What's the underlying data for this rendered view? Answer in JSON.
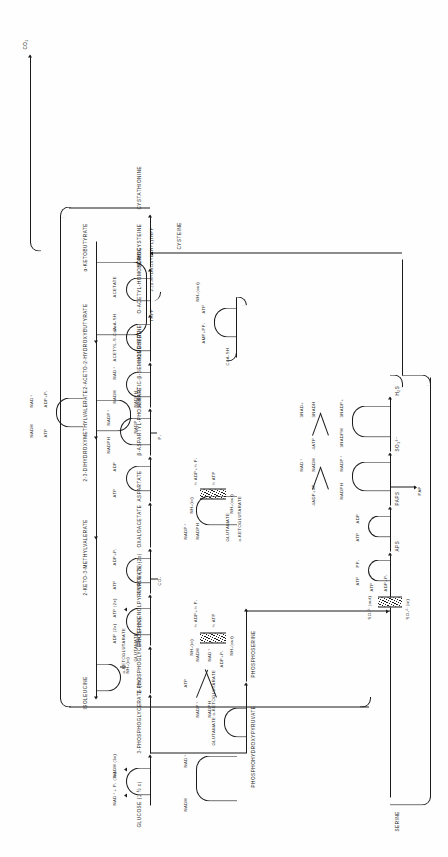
{
  "figure": {
    "kind": "biochemical-pathway-diagram",
    "orientation": "rotated-90-counterclockwise",
    "ink": "#1b1b1b",
    "paper": "#fefefe"
  },
  "metabolites": {
    "glucose": "GLUCOSE (1 ½ x)",
    "pg3": "3-PHOSPHOGLYCERATE (3x)",
    "pg2": "2-PHOSPHOGLYCERATE (2x)",
    "pep": "PHOSPHOENOLPYRUVATE (2x)",
    "pyruvate": "PYRUVATE (2x)",
    "oxaloacetate": "OXALOACETATE",
    "aspartate": "ASPARTATE",
    "aspartyl_phosphate": "β-ASPARTYL-PHOSPHATE",
    "aspartic_semialdehyde": "ASPARTIC-β-SEMIALDEHYDE",
    "homoserine": "HOMOSERINE",
    "o_acetyl_homoserine": "O-ACETYL-HOMOSERINE",
    "homocysteine": "HOMOCYSTEINE",
    "cystathionine": "CYSTATHIONINE",
    "phosphohydroxypyruvate": "PHOSPHOHYDROXYPYRUVATE",
    "phosphoserine": "PHOSPHOSERINE",
    "serine": "SERINE",
    "cysteine": "CYSTEINE",
    "ketobutyrate": "α-KETOBUTYRATE",
    "hydroxyethyl_thpp": "2-(α-HYDROXYETHYL)THPP",
    "aceto_hydroxybutyrate": "2-ACETO-2-HYDROXYBUTYRATE",
    "dihydroxymethylvalerate": "2-3-DIHYDROXYMETHYLVALERATE",
    "keto_methylvalerate": "2-KETO-3-METHYLVALERATE",
    "isoleucine": "ISOLEUCINE",
    "sulfate_out": "SO₄²⁻(out)",
    "sulfate_in": "SO₄²⁻(in)",
    "aps": "APS",
    "paps": "PAPS",
    "pap": "PAP",
    "sulfite": "SO₃²⁻",
    "sulfide": "H₂S",
    "co2": "CO₂"
  },
  "cofactors": {
    "nad_pi_3x": "NAD⁺ + P₁ (3x)",
    "nadh_3x": "NADH (3x)",
    "adp_2x": "ADP (2x)",
    "atp_2x": "ATP (2x)",
    "atp": "ATP",
    "adp": "ADP",
    "adp_pi": "ADP+P₁",
    "nad_plus": "NAD⁺",
    "nadh": "NADH",
    "nadp_plus": "NADP⁺",
    "nadph": "NADPH",
    "nh3_in": "NH₃(in)",
    "nh3_out": "NH₃(out)",
    "half_adp_half_pi": "½ ADP+½ P₁",
    "half_atp": "½ ATP",
    "acetyl_coa": "ACETYL-S-CoA",
    "coa_sh": "CoA-SH",
    "acetate": "ACETATE",
    "amp_ppi": "AMP+PP₁",
    "ppi": "PP₁",
    "pi": "P₁",
    "thpp": "THPP",
    "four_adp_four_pi": "4ADP+4P₁",
    "four_atp": "4ATP",
    "three_nad_plus": "3NAD+",
    "three_nadh": "3NADH",
    "three_nadph": "3NADPH",
    "three_nadp_plus": "3NADP+",
    "alpha_kg": "α-KETOGLUTARATE",
    "glutamate": "GLUTAMATE"
  },
  "nodes": [
    {
      "id": "glucose",
      "label": "GLUCOSE (1 ½ x)"
    },
    {
      "id": "pg3",
      "label": "3-PHOSPHOGLYCERATE (3x)"
    },
    {
      "id": "pg2",
      "label": "2-PHOSPHOGLYCERATE (2x)"
    },
    {
      "id": "pep",
      "label": "PHOSPHOENOLPYRUVATE (2x)"
    },
    {
      "id": "pyruvate",
      "label": "PYRUVATE (2x)"
    },
    {
      "id": "oaa",
      "label": "OXALOACETATE"
    },
    {
      "id": "asp",
      "label": "ASPARTATE"
    },
    {
      "id": "aspp",
      "label": "β-ASPARTYL-PHOSPHATE"
    },
    {
      "id": "asa",
      "label": "ASPARTIC-β-SEMIALDEHYDE"
    },
    {
      "id": "hse",
      "label": "HOMOSERINE"
    },
    {
      "id": "oah",
      "label": "O-ACETYL-HOMOSERINE"
    },
    {
      "id": "hcys",
      "label": "HOMOCYSTEINE"
    },
    {
      "id": "cysta",
      "label": "CYSTATHIONINE"
    },
    {
      "id": "akb",
      "label": "α-KETOBUTYRATE"
    },
    {
      "id": "het",
      "label": "2-(α-HYDROXYETHYL)THPP"
    },
    {
      "id": "ahb",
      "label": "2-ACETO-2-HYDROXYBUTYRATE"
    },
    {
      "id": "dhmv",
      "label": "2-3-DIHYDROXYMETHYLVALERATE"
    },
    {
      "id": "kmv",
      "label": "2-KETO-3-METHYLVALERATE"
    },
    {
      "id": "ile",
      "label": "ISOLEUCINE"
    },
    {
      "id": "phpyr",
      "label": "PHOSPHOHYDROXYPYRUVATE"
    },
    {
      "id": "pser",
      "label": "PHOSPHOSERINE"
    },
    {
      "id": "ser",
      "label": "SERINE"
    },
    {
      "id": "cys",
      "label": "CYSTEINE"
    },
    {
      "id": "so4out",
      "label": "SO₄²⁻(out)"
    },
    {
      "id": "so4in",
      "label": "SO₄²⁻(in)"
    },
    {
      "id": "aps",
      "label": "APS"
    },
    {
      "id": "paps",
      "label": "PAPS"
    },
    {
      "id": "so3",
      "label": "SO₃²⁻"
    },
    {
      "id": "h2s",
      "label": "H₂S"
    },
    {
      "id": "pap",
      "label": "PAP"
    },
    {
      "id": "co2",
      "label": "CO₂"
    }
  ]
}
